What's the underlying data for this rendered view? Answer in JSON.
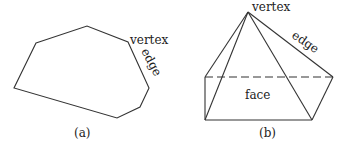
{
  "figure_a": {
    "caption": "(a)",
    "labels": {
      "vertex": "vertex",
      "edge": "edge"
    },
    "polygon_points": [
      [
        36,
        43
      ],
      [
        87,
        26
      ],
      [
        128,
        42
      ],
      [
        149,
        88
      ],
      [
        140,
        107
      ],
      [
        117,
        118
      ],
      [
        14,
        88
      ]
    ]
  },
  "figure_b": {
    "caption": "(b)",
    "labels": {
      "vertex": "vertex",
      "edge": "edge",
      "face": "face"
    },
    "apex": [
      248,
      12
    ],
    "base": {
      "front_left": [
        205,
        120
      ],
      "front_right": [
        312,
        120
      ],
      "back_left": [
        205,
        77
      ],
      "back_right": [
        333,
        77
      ]
    }
  },
  "colors": {
    "stroke": "#333333",
    "text": "#222222",
    "background": "#ffffff"
  }
}
